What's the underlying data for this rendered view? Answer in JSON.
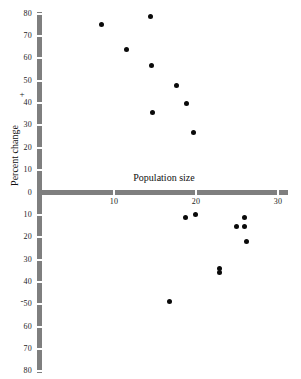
{
  "chart_data": {
    "type": "scatter",
    "title": "",
    "xlabel": "Population size",
    "ylabel": "Percent change",
    "xlim": [
      0,
      30
    ],
    "ylim": [
      -80,
      80
    ],
    "grid": false,
    "legend": null,
    "x_ticks": [
      10,
      20,
      30
    ],
    "x_tick_labels": [
      "10",
      "20",
      "30"
    ],
    "y_ticks": [
      80,
      70,
      60,
      50,
      40,
      30,
      20,
      10,
      0,
      -10,
      -20,
      -30,
      -40,
      -50,
      -60,
      -70,
      -80
    ],
    "y_tick_labels": [
      "80",
      "70",
      "60",
      "50",
      "40",
      "30",
      "20",
      "10",
      "0",
      "10",
      "20",
      "30",
      "40",
      "50",
      "60",
      "70",
      "80"
    ],
    "sign_markers": {
      "positive": "+",
      "negative": "-"
    },
    "points": [
      {
        "x": 8.5,
        "y": 75
      },
      {
        "x": 14.4,
        "y": 79
      },
      {
        "x": 11.5,
        "y": 64
      },
      {
        "x": 14.6,
        "y": 57
      },
      {
        "x": 17.6,
        "y": 48
      },
      {
        "x": 18.9,
        "y": 40
      },
      {
        "x": 14.7,
        "y": 36
      },
      {
        "x": 19.7,
        "y": 27
      },
      {
        "x": 18.7,
        "y": -11
      },
      {
        "x": 19.9,
        "y": -10
      },
      {
        "x": 25.9,
        "y": -11
      },
      {
        "x": 24.9,
        "y": -15
      },
      {
        "x": 25.9,
        "y": -15
      },
      {
        "x": 26.1,
        "y": -22
      },
      {
        "x": 22.9,
        "y": -34
      },
      {
        "x": 22.9,
        "y": -36
      },
      {
        "x": 16.8,
        "y": -49
      }
    ]
  },
  "style": {
    "axis_color": "#7f7f7f",
    "point_color": "#0a0a0a",
    "background_color": "#ffffff",
    "text_color": "#222222"
  }
}
